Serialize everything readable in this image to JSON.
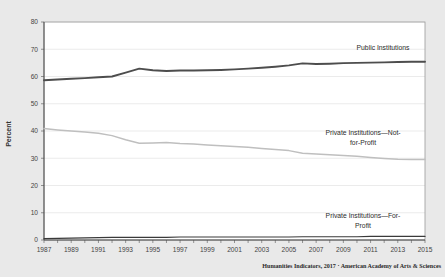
{
  "chart_data": {
    "type": "line",
    "title": "",
    "xlabel": "",
    "ylabel": "Percent",
    "xlim": [
      1987,
      2015
    ],
    "ylim": [
      0,
      80
    ],
    "grid": true,
    "legend_position": "inline-annotations",
    "x": [
      1987,
      1988,
      1989,
      1990,
      1991,
      1992,
      1993,
      1994,
      1995,
      1996,
      1997,
      1998,
      1999,
      2000,
      2001,
      2002,
      2003,
      2004,
      2005,
      2006,
      2007,
      2008,
      2009,
      2010,
      2011,
      2012,
      2013,
      2014,
      2015
    ],
    "xticks": [
      "1987",
      "1989",
      "1991",
      "1993",
      "1995",
      "1997",
      "1999",
      "2001",
      "2003",
      "2005",
      "2007",
      "2009",
      "2011",
      "2013",
      "2015"
    ],
    "yticks": [
      "0",
      "10",
      "20",
      "30",
      "40",
      "50",
      "60",
      "70",
      "80"
    ],
    "series": [
      {
        "name": "Public Institutions",
        "color": "#4d4d4d",
        "width": 1.9,
        "values": [
          58.6,
          58.9,
          59.2,
          59.4,
          59.7,
          60.0,
          61.4,
          62.9,
          62.3,
          62.0,
          62.2,
          62.2,
          62.3,
          62.4,
          62.6,
          62.9,
          63.2,
          63.6,
          64.1,
          64.8,
          64.6,
          64.7,
          64.9,
          65.0,
          65.1,
          65.2,
          65.3,
          65.4,
          65.4
        ]
      },
      {
        "name": "Private Institutions—Not-for-Profit",
        "color": "#bfbfbf",
        "width": 1.5,
        "values": [
          40.9,
          40.4,
          40.0,
          39.6,
          39.2,
          38.3,
          36.8,
          35.5,
          35.6,
          35.8,
          35.4,
          35.2,
          34.9,
          34.6,
          34.3,
          34.0,
          33.6,
          33.2,
          32.8,
          31.8,
          31.6,
          31.3,
          31.0,
          30.7,
          30.3,
          29.9,
          29.6,
          29.5,
          29.5
        ]
      },
      {
        "name": "Private Institutions—For-Profit",
        "color": "#3a3a3a",
        "width": 1.2,
        "values": [
          0.5,
          0.6,
          0.7,
          0.8,
          0.9,
          1.0,
          1.0,
          1.0,
          1.0,
          1.0,
          1.1,
          1.1,
          1.1,
          1.1,
          1.1,
          1.1,
          1.1,
          1.1,
          1.1,
          1.2,
          1.2,
          1.2,
          1.2,
          1.2,
          1.3,
          1.3,
          1.3,
          1.3,
          1.3
        ]
      }
    ],
    "annotations": [
      {
        "text": "Public Institutions",
        "lines": [
          "Public Institutions"
        ]
      },
      {
        "text": "Private Institutions—Not-for-Profit",
        "lines": [
          "Private Institutions—Not-",
          "for-Profit"
        ]
      },
      {
        "text": "Private Institutions—For-Profit",
        "lines": [
          "Private Institutions—For-",
          "Profit"
        ]
      }
    ]
  },
  "credit": {
    "text": "Humanities Indicators, 2017 · American Academy of Arts & Sciences"
  },
  "colors": {
    "background": "#e9e9e9",
    "plot_background": "#ffffff",
    "gridline": "#e2e2e2",
    "frame": "#9a9a9a",
    "axis": "#4a4a4a"
  }
}
